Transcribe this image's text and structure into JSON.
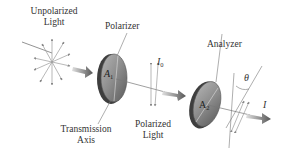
{
  "diagram": {
    "type": "polarization",
    "labels": {
      "unpolarized_line1": "Unpolarized",
      "unpolarized_line2": "Light",
      "polarizer": "Polarizer",
      "analyzer": "Analyzer",
      "transmission_line1": "Transmission",
      "transmission_line2": "Axis",
      "polarized_line1": "Polarized",
      "polarized_line2": "Light"
    },
    "symbols": {
      "a1_main": "A",
      "a1_sub": "1",
      "a2_main": "A",
      "a2_sub": "2",
      "i0_main": "I",
      "i0_sub": "0",
      "i_out": "I",
      "theta": "θ"
    },
    "colors": {
      "disk": "#8a8a8a",
      "disk_dark": "#4a4a4a",
      "arrow": "#6a6a6a",
      "lines": "#7a7a7a",
      "text": "#333333"
    }
  }
}
